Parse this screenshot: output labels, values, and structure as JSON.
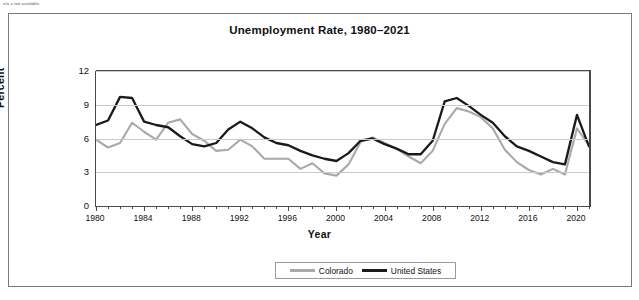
{
  "note": "n/a = not available.",
  "chart_data": {
    "type": "line",
    "title": "Unemployment Rate, 1980–2021",
    "xlabel": "Year",
    "ylabel": "Percent",
    "xlim": [
      1980,
      2021
    ],
    "ylim": [
      0,
      12
    ],
    "yticks": [
      "0",
      "3",
      "6",
      "9",
      "12"
    ],
    "ytick_values": [
      0,
      3,
      6,
      9,
      12
    ],
    "xticks": [
      "1980",
      "1984",
      "1988",
      "1992",
      "1996",
      "2000",
      "2004",
      "2008",
      "2012",
      "2016",
      "2020"
    ],
    "xtick_values": [
      1980,
      1984,
      1988,
      1992,
      1996,
      2000,
      2004,
      2008,
      2012,
      2016,
      2020
    ],
    "grid": true,
    "legend_position": "bottom",
    "x": [
      1980,
      1981,
      1982,
      1983,
      1984,
      1985,
      1986,
      1987,
      1988,
      1989,
      1990,
      1991,
      1992,
      1993,
      1994,
      1995,
      1996,
      1997,
      1998,
      1999,
      2000,
      2001,
      2002,
      2003,
      2004,
      2005,
      2006,
      2007,
      2008,
      2009,
      2010,
      2011,
      2012,
      2013,
      2014,
      2015,
      2016,
      2017,
      2018,
      2019,
      2020,
      2021
    ],
    "series": [
      {
        "name": "Colorado",
        "color": "#a9a9a9",
        "values": [
          5.9,
          5.2,
          5.6,
          7.4,
          6.6,
          5.9,
          7.4,
          7.7,
          6.4,
          5.8,
          4.9,
          5.0,
          5.9,
          5.3,
          4.2,
          4.2,
          4.2,
          3.3,
          3.8,
          2.9,
          2.7,
          3.7,
          5.7,
          6.1,
          5.6,
          5.1,
          4.4,
          3.8,
          4.9,
          7.3,
          8.7,
          8.4,
          7.9,
          6.9,
          5.0,
          3.9,
          3.2,
          2.8,
          3.3,
          2.8,
          6.9,
          5.4
        ],
        "last_value": 5.4,
        "peak_value": 8.7,
        "peak_year": 2010,
        "min_value": 2.7,
        "min_year": 2000
      },
      {
        "name": "United States",
        "color": "#1a1a1a",
        "values": [
          7.2,
          7.6,
          9.7,
          9.6,
          7.5,
          7.2,
          7.0,
          6.2,
          5.5,
          5.3,
          5.6,
          6.8,
          7.5,
          6.9,
          6.1,
          5.6,
          5.4,
          4.9,
          4.5,
          4.2,
          4.0,
          4.7,
          5.8,
          6.0,
          5.5,
          5.1,
          4.6,
          4.6,
          5.8,
          9.3,
          9.6,
          8.9,
          8.1,
          7.4,
          6.2,
          5.3,
          4.9,
          4.4,
          3.9,
          3.7,
          8.1,
          5.3
        ],
        "last_value": 5.3,
        "peak_value": 9.7,
        "peak_year": 1982,
        "min_value": 3.7,
        "min_year": 2019
      }
    ]
  },
  "legend": {
    "items": [
      {
        "label": "Colorado",
        "color": "#a9a9a9"
      },
      {
        "label": "United States",
        "color": "#1a1a1a"
      }
    ]
  }
}
